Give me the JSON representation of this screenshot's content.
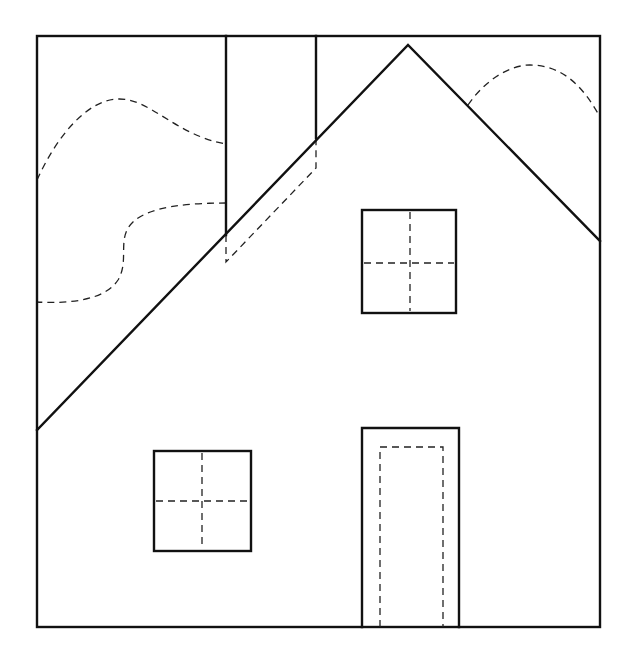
{
  "figure": {
    "type": "line-drawing",
    "colors": {
      "background": "#ffffff",
      "line": "#111111",
      "dashed_line": "#222222"
    }
  },
  "elements": {
    "frame": {
      "x": 37,
      "y": 36,
      "w": 563,
      "h": 591
    },
    "roof": {
      "left": [
        37,
        430
      ],
      "peak": [
        408,
        45
      ],
      "right": [
        600,
        241
      ]
    },
    "chimney": {
      "left_x": 226,
      "right_x": 316,
      "top_y": 36,
      "left_bottom_y": 235,
      "right_bottom_y": 138,
      "hidden_base_y_left": 262,
      "hidden_base_y_right": 168
    },
    "upper_window": {
      "x": 362,
      "y": 210,
      "w": 94,
      "h": 103
    },
    "lower_window": {
      "x": 154,
      "y": 451,
      "w": 97,
      "h": 100
    },
    "door": {
      "x": 362,
      "y": 428,
      "w": 97,
      "h": 199,
      "inner": {
        "x": 380,
        "y": 447,
        "w": 63
      }
    },
    "hills": {
      "left_upper": "dashed curve from frame left edge (y≈180) rising to crest (~x 118, y 99) and descending to chimney (y≈144)",
      "left_lower": "dashed S-curve from chimney (y≈203) to frame left edge (y≈302)",
      "right": "dashed arc from roof (~x 468, y 105) cresting (~x 530, y 65) to frame right edge (y≈117)"
    }
  }
}
